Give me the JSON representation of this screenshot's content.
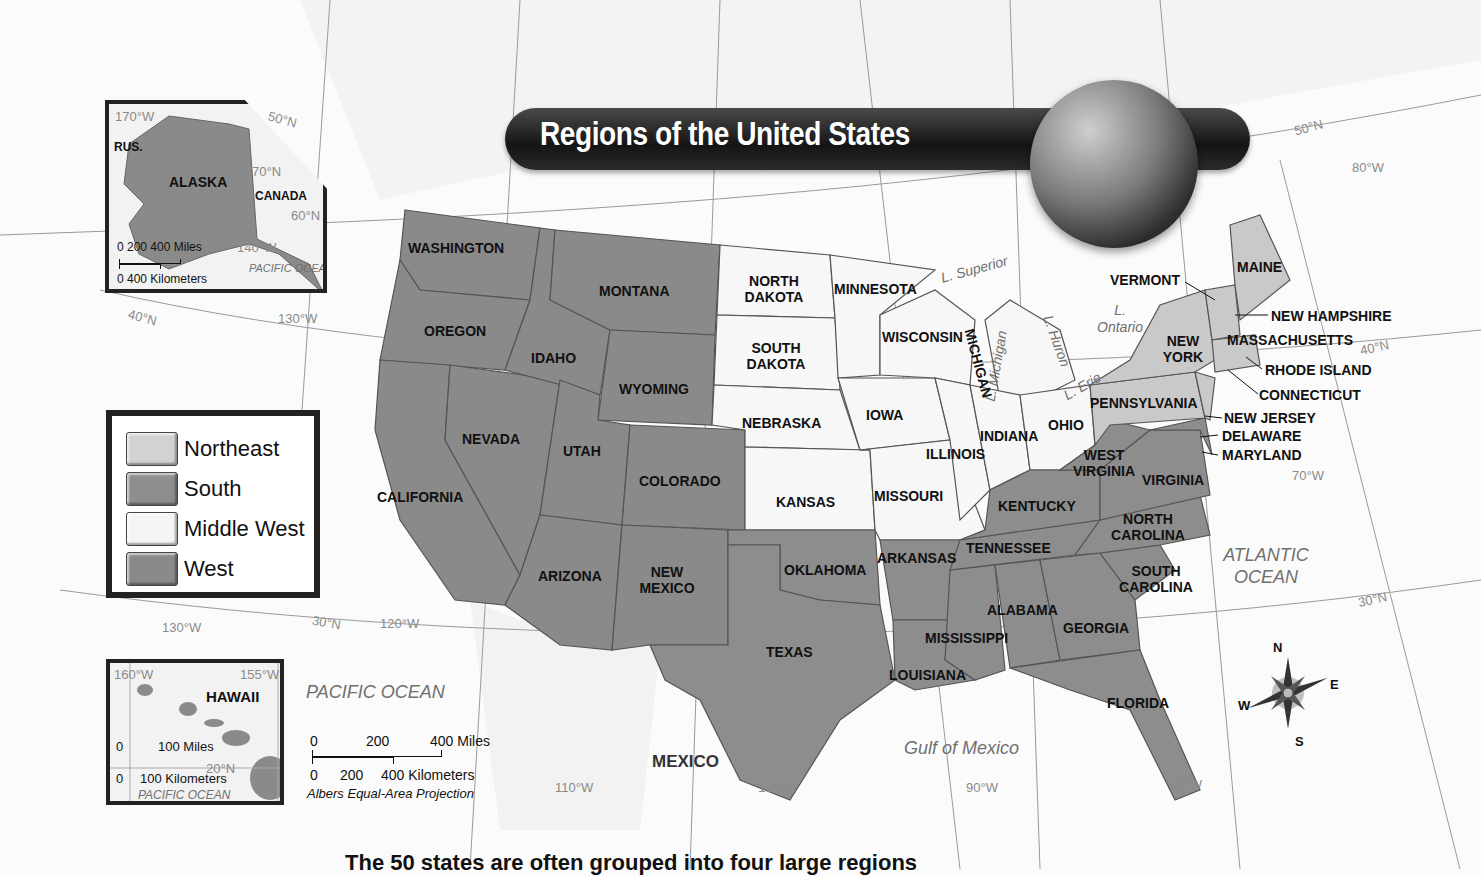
{
  "title": "Regions of the United States",
  "legend": {
    "items": [
      {
        "label": "Northeast",
        "color": "#d2d2d2"
      },
      {
        "label": "South",
        "color": "#8e8e8e"
      },
      {
        "label": "Middle West",
        "color": "#f4f4f4"
      },
      {
        "label": "West",
        "color": "#8a8a8a"
      }
    ]
  },
  "colors": {
    "northeast": "#c9c9c9",
    "south": "#8d8d8d",
    "middle_west": "#f7f7f7",
    "west": "#888888",
    "ocean": "#fbfbfb",
    "land_other": "#efefef",
    "title_bar": "#1a1a1a"
  },
  "states": {
    "washington": "WASHINGTON",
    "oregon": "OREGON",
    "california": "CALIFORNIA",
    "nevada": "NEVADA",
    "idaho": "IDAHO",
    "montana": "MONTANA",
    "wyoming": "WYOMING",
    "utah": "UTAH",
    "colorado": "COLORADO",
    "arizona": "ARIZONA",
    "new_mexico": "NEW MEXICO",
    "north_dakota": "NORTH DAKOTA",
    "south_dakota": "SOUTH DAKOTA",
    "nebraska": "NEBRASKA",
    "kansas": "KANSAS",
    "minnesota": "MINNESOTA",
    "iowa": "IOWA",
    "missouri": "MISSOURI",
    "wisconsin": "WISCONSIN",
    "illinois": "ILLINOIS",
    "michigan": "MICHIGAN",
    "indiana": "INDIANA",
    "ohio": "OHIO",
    "oklahoma": "OKLAHOMA",
    "texas": "TEXAS",
    "arkansas": "ARKANSAS",
    "louisiana": "LOUISIANA",
    "mississippi": "MISSISSIPPI",
    "alabama": "ALABAMA",
    "tennessee": "TENNESSEE",
    "kentucky": "KENTUCKY",
    "georgia": "GEORGIA",
    "florida": "FLORIDA",
    "south_carolina": "SOUTH CAROLINA",
    "north_carolina": "NORTH CAROLINA",
    "virginia": "VIRGINIA",
    "west_virginia": "WEST VIRGINIA",
    "maryland": "MARYLAND",
    "delaware": "DELAWARE",
    "pennsylvania": "PENNSYLVANIA",
    "new_york": "NEW YORK",
    "new_jersey": "NEW JERSEY",
    "connecticut": "CONNECTICUT",
    "rhode_island": "RHODE ISLAND",
    "massachusetts": "MASSACHUSETTS",
    "vermont": "VERMONT",
    "new_hampshire": "NEW HAMPSHIRE",
    "maine": "MAINE"
  },
  "water": {
    "pacific": "PACIFIC OCEAN",
    "atlantic": "ATLANTIC OCEAN",
    "gulf": "Gulf of Mexico",
    "superior": "L. Superior",
    "michigan": "L. Michigan",
    "huron": "L. Huron",
    "erie": "L. Erie",
    "ontario": "L. Ontario"
  },
  "countries": {
    "mexico": "MEXICO"
  },
  "grid": {
    "lat": [
      "50°N",
      "40°N",
      "30°N",
      "50°N",
      "40°N",
      "30°N"
    ],
    "lon": [
      "130°W",
      "120°W",
      "110°W",
      "100°W",
      "90°W",
      "80°W",
      "70°W",
      "80°W",
      "130°W"
    ]
  },
  "scale": {
    "miles_ticks": [
      "0",
      "200",
      "400 Miles"
    ],
    "km_ticks": [
      "0",
      "200",
      "400 Kilometers"
    ],
    "projection": "Albers Equal-Area Projection"
  },
  "alaska_inset": {
    "title": "ALASKA",
    "labels": {
      "russia": "RUS.",
      "canada": "CANADA",
      "ocean": "PACIFIC OCEAN"
    },
    "grid": [
      "170°W",
      "70°N",
      "60°N",
      "140°W",
      "50°N"
    ],
    "scale_miles": "0  200 400 Miles",
    "scale_km": "0    400 Kilometers"
  },
  "hawaii_inset": {
    "title": "HAWAII",
    "grid": [
      "160°W",
      "155°W",
      "20°N"
    ],
    "scale_miles": "100 Miles",
    "scale_km": "100 Kilometers",
    "zero": "0",
    "ocean": "PACIFIC OCEAN"
  },
  "compass": {
    "n": "N",
    "s": "S",
    "e": "E",
    "w": "W"
  },
  "caption": "The 50 states are often grouped into four large regions"
}
